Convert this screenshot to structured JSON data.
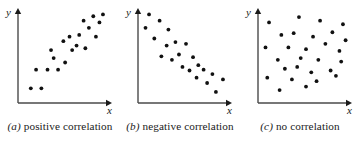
{
  "figure": {
    "background": "#ffffff",
    "ink_color": "#1a1a1a",
    "axis_color": "#4a4a4a",
    "dot_color": "#111111",
    "dot_radius": 1.9,
    "panel_width": 120,
    "plot": {
      "origin_x": 18,
      "origin_y": 103,
      "x_axis_end": 112,
      "y_axis_top": 8
    }
  },
  "panels": [
    {
      "id": "positive",
      "caption_tag": "(a)",
      "caption_text": "positive correlation",
      "x_axis_label": "x",
      "y_axis_label": "y",
      "chart_ref": 0
    },
    {
      "id": "negative",
      "caption_tag": "(b)",
      "caption_text": "negative correlation",
      "x_axis_label": "x",
      "y_axis_label": "y",
      "chart_ref": 1
    },
    {
      "id": "none",
      "caption_tag": "(c)",
      "caption_text": "no correlation",
      "x_axis_label": "x",
      "y_axis_label": "y",
      "chart_ref": 2
    }
  ],
  "chart_data": [
    {
      "type": "scatter",
      "title": "(a) positive correlation",
      "xlabel": "x",
      "ylabel": "y",
      "xlim": [
        0,
        100
      ],
      "ylim": [
        0,
        100
      ],
      "grid": false,
      "legend": false,
      "axis_ticks": false,
      "series": [
        {
          "name": "positive correlation",
          "points": [
            [
              10,
              12
            ],
            [
              22,
              12
            ],
            [
              16,
              33
            ],
            [
              29,
              33
            ],
            [
              41,
              33
            ],
            [
              36,
              46
            ],
            [
              49,
              41
            ],
            [
              33,
              55
            ],
            [
              57,
              55
            ],
            [
              47,
              65
            ],
            [
              54,
              70
            ],
            [
              62,
              60
            ],
            [
              65,
              72
            ],
            [
              72,
              57
            ],
            [
              76,
              80
            ],
            [
              70,
              88
            ],
            [
              84,
              70
            ],
            [
              88,
              86
            ],
            [
              92,
              95
            ],
            [
              81,
              93
            ]
          ]
        }
      ]
    },
    {
      "type": "scatter",
      "title": "(b) negative correlation",
      "xlabel": "x",
      "ylabel": "y",
      "xlim": [
        0,
        100
      ],
      "ylim": [
        0,
        100
      ],
      "grid": false,
      "legend": false,
      "axis_ticks": false,
      "series": [
        {
          "name": "negative correlation",
          "points": [
            [
              8,
              95
            ],
            [
              20,
              88
            ],
            [
              4,
              80
            ],
            [
              30,
              78
            ],
            [
              14,
              68
            ],
            [
              38,
              64
            ],
            [
              28,
              60
            ],
            [
              50,
              62
            ],
            [
              22,
              48
            ],
            [
              42,
              50
            ],
            [
              34,
              44
            ],
            [
              58,
              47
            ],
            [
              46,
              36
            ],
            [
              64,
              38
            ],
            [
              54,
              32
            ],
            [
              70,
              33
            ],
            [
              62,
              24
            ],
            [
              80,
              28
            ],
            [
              74,
              18
            ],
            [
              92,
              22
            ],
            [
              84,
              8
            ]
          ]
        }
      ]
    },
    {
      "type": "scatter",
      "title": "(c) no correlation",
      "xlabel": "x",
      "ylabel": "y",
      "xlim": [
        0,
        100
      ],
      "ylim": [
        0,
        100
      ],
      "grid": false,
      "legend": false,
      "axis_ticks": false,
      "series": [
        {
          "name": "no correlation",
          "points": [
            [
              8,
              86
            ],
            [
              42,
              92
            ],
            [
              66,
              88
            ],
            [
              92,
              84
            ],
            [
              22,
              72
            ],
            [
              36,
              74
            ],
            [
              58,
              70
            ],
            [
              80,
              75
            ],
            [
              95,
              66
            ],
            [
              4,
              58
            ],
            [
              30,
              58
            ],
            [
              50,
              56
            ],
            [
              72,
              62
            ],
            [
              88,
              54
            ],
            [
              18,
              44
            ],
            [
              44,
              46
            ],
            [
              64,
              44
            ],
            [
              90,
              42
            ],
            [
              26,
              34
            ],
            [
              40,
              36
            ],
            [
              56,
              30
            ],
            [
              78,
              32
            ],
            [
              6,
              24
            ],
            [
              34,
              22
            ],
            [
              62,
              20
            ],
            [
              84,
              26
            ],
            [
              20,
              10
            ],
            [
              50,
              14
            ]
          ]
        }
      ]
    }
  ]
}
